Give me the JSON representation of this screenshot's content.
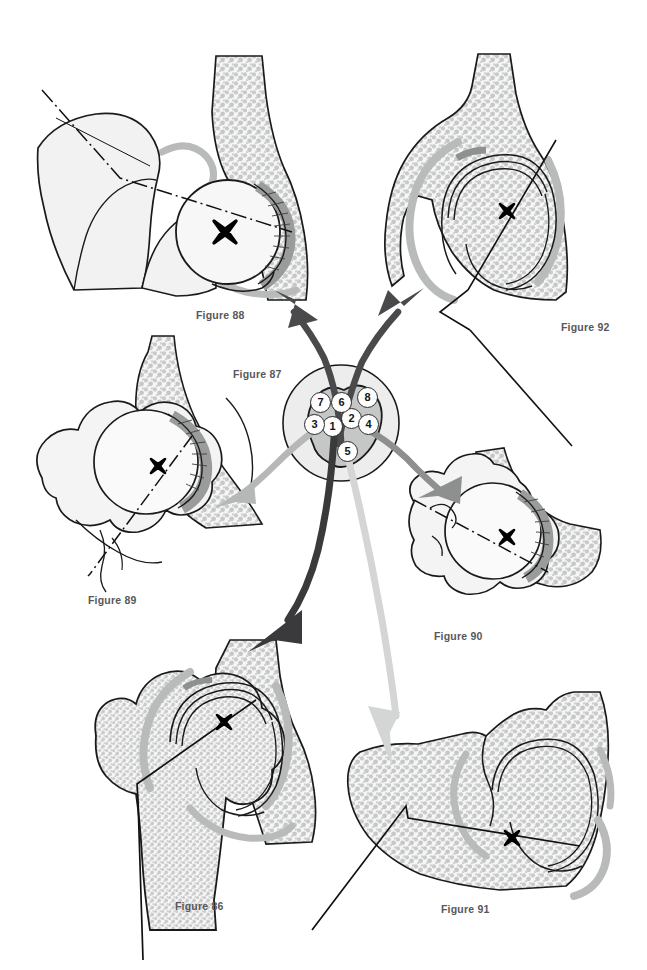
{
  "figure_plate": {
    "title_visible": false,
    "background": "#ffffff",
    "subject": "hip-joint-anatomical-figure-plate"
  },
  "palette": {
    "outline": "#1a1a1a",
    "bone_fill": "#f2f2f2",
    "trabecular_stipple": "#c9cbca",
    "cartilage_gray": "#a8aaa9",
    "capsule_gray": "#b9bbba",
    "label_text": "#58585a",
    "arrow_dark": "#4a4a4c",
    "arrow_black": "#3a3a3c",
    "arrow_mid": "#8e9090",
    "arrow_light": "#b6b8b7",
    "arrow_pale": "#d4d6d5",
    "marker_black": "#000000",
    "hub_circle_fill": "#fdfdfd"
  },
  "hub": {
    "label": "Figure 87",
    "label_x": 233,
    "label_y": 368,
    "center_x": 341,
    "center_y": 423,
    "radius": 58,
    "numbers": [
      {
        "n": "1",
        "x": 333,
        "y": 427
      },
      {
        "n": "2",
        "x": 352,
        "y": 419
      },
      {
        "n": "3",
        "x": 315,
        "y": 425
      },
      {
        "n": "4",
        "x": 369,
        "y": 425
      },
      {
        "n": "5",
        "x": 348,
        "y": 452
      },
      {
        "n": "6",
        "x": 342,
        "y": 403
      },
      {
        "n": "7",
        "x": 321,
        "y": 403
      },
      {
        "n": "8",
        "x": 368,
        "y": 398
      }
    ]
  },
  "figures": [
    {
      "id": "fig88",
      "label": "Figure 88",
      "label_x": 196,
      "label_y": 309,
      "view": "anterior-oblique hip with femoral head and iliac wing",
      "marker": "X",
      "marker_x": 225,
      "marker_y": 232,
      "marker_size": "large",
      "axis_style": "dash-dot",
      "arrow_from_hub_color": "#4a4a4c",
      "arrow_target_x": 277,
      "arrow_target_y": 303
    },
    {
      "id": "fig92",
      "label": "Figure 92",
      "label_x": 561,
      "label_y": 321,
      "view": "coronal acetabulum and ilium cross-section",
      "marker": "X",
      "marker_x": 507,
      "marker_y": 211,
      "marker_size": "small",
      "axis_style": "solid-black",
      "arrow_from_hub_color": "#4a4a4c",
      "arrow_target_x": 404,
      "arrow_target_y": 296
    },
    {
      "id": "fig89",
      "label": "Figure 89",
      "label_x": 88,
      "label_y": 594,
      "view": "superior view of femoral head with greater trochanter",
      "marker": "X",
      "marker_x": 158,
      "marker_y": 466,
      "marker_size": "small",
      "axis_style": "dash-dot",
      "arrow_from_hub_color": "#b6b8b7",
      "arrow_target_x": 214,
      "arrow_target_y": 495
    },
    {
      "id": "fig90",
      "label": "Figure 90",
      "label_x": 434,
      "label_y": 630,
      "view": "inferior-oblique femoral head with acetabular rim",
      "marker": "X",
      "marker_x": 507,
      "marker_y": 537,
      "marker_size": "small",
      "axis_style": "dash-dot",
      "arrow_from_hub_color": "#8e9090",
      "arrow_target_x": 419,
      "arrow_target_y": 500
    },
    {
      "id": "fig86",
      "label": "Figure 86",
      "label_x": 175,
      "label_y": 900,
      "view": "anteroposterior hip with proximal femur and shaft",
      "marker": "X",
      "marker_x": 224,
      "marker_y": 722,
      "marker_size": "small",
      "axis_style": "solid-black-bent",
      "arrow_from_hub_color": "#3a3a3c",
      "arrow_target_x": 252,
      "arrow_target_y": 645
    },
    {
      "id": "fig91",
      "label": "Figure 91",
      "label_x": 441,
      "label_y": 903,
      "view": "lateral pelvis with acetabulum and femoral head",
      "marker": "X",
      "marker_x": 512,
      "marker_y": 838,
      "marker_size": "small",
      "axis_style": "solid-black-bent",
      "arrow_from_hub_color": "#d4d6d5",
      "arrow_target_x": 392,
      "arrow_target_y": 760
    }
  ]
}
